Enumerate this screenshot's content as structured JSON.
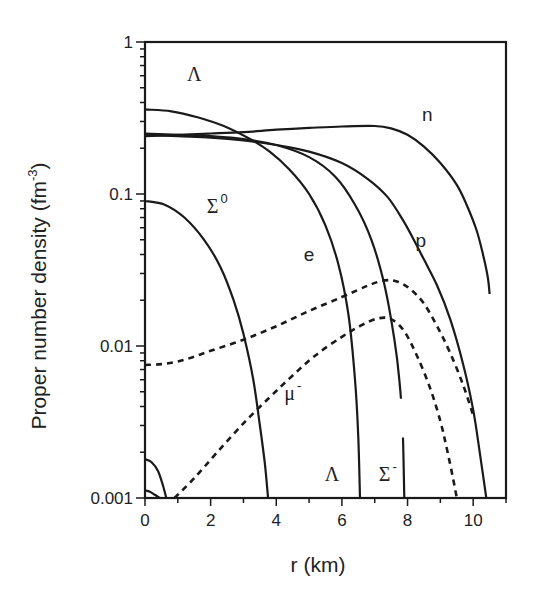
{
  "chart_data": {
    "type": "line",
    "title": "",
    "xlabel": "r (km)",
    "ylabel": "Proper number density (fm^-3)",
    "ylabel_parts": {
      "main": "Proper number density (fm",
      "sup": "-3",
      "close": ")"
    },
    "xlim": [
      0,
      11
    ],
    "ylim": [
      0.001,
      1
    ],
    "yscale": "log",
    "grid": false,
    "x_ticks": [
      0,
      2,
      4,
      6,
      8,
      10
    ],
    "x_tick_labels": [
      "0",
      "2",
      "4",
      "6",
      "8",
      "10"
    ],
    "y_ticks": [
      1,
      0.1,
      0.01,
      0.001
    ],
    "y_tick_labels": [
      "1",
      "0.1",
      "0.01",
      "0.001"
    ],
    "series": [
      {
        "name": "n",
        "style": "solid",
        "x": [
          0,
          1,
          2,
          3,
          4,
          5,
          6,
          7,
          7.5,
          8,
          8.5,
          9,
          9.5,
          9.8,
          10.1,
          10.3,
          10.45,
          10.5
        ],
        "y": [
          0.24,
          0.245,
          0.25,
          0.255,
          0.265,
          0.272,
          0.278,
          0.28,
          0.27,
          0.245,
          0.205,
          0.16,
          0.115,
          0.085,
          0.058,
          0.04,
          0.028,
          0.022
        ]
      },
      {
        "name": "p",
        "style": "solid",
        "x": [
          0,
          1,
          2,
          3,
          4,
          5,
          6,
          6.8,
          7.4,
          7.9,
          8.3,
          8.5,
          8.9,
          9.3,
          9.7,
          10.0,
          10.2,
          10.4
        ],
        "y": [
          0.245,
          0.24,
          0.235,
          0.225,
          0.21,
          0.19,
          0.16,
          0.125,
          0.095,
          0.065,
          0.045,
          0.037,
          0.025,
          0.015,
          0.0075,
          0.0038,
          0.002,
          0.001
        ]
      },
      {
        "name": "Σ-",
        "style": "solid",
        "x": [
          0,
          1,
          2,
          3,
          4,
          5,
          5.8,
          6.4,
          6.9,
          7.3,
          7.6,
          7.75,
          7.85,
          7.9
        ],
        "y": [
          0.25,
          0.245,
          0.24,
          0.23,
          0.21,
          0.175,
          0.13,
          0.085,
          0.05,
          0.025,
          0.011,
          0.006,
          0.003,
          0.001
        ],
        "gap": [
          0.0045,
          0.0025
        ]
      },
      {
        "name": "Λ",
        "style": "solid",
        "x": [
          0,
          0.8,
          1.6,
          2.4,
          3.2,
          3.8,
          4.4,
          5.0,
          5.5,
          5.9,
          6.2,
          6.4,
          6.5,
          6.55
        ],
        "y": [
          0.36,
          0.35,
          0.32,
          0.28,
          0.23,
          0.19,
          0.145,
          0.1,
          0.062,
          0.034,
          0.016,
          0.006,
          0.0025,
          0.001
        ]
      },
      {
        "name": "Σ0",
        "style": "solid",
        "x": [
          0,
          0.6,
          1.2,
          1.8,
          2.3,
          2.7,
          3.0,
          3.3,
          3.5,
          3.65,
          3.75
        ],
        "y": [
          0.09,
          0.085,
          0.07,
          0.05,
          0.033,
          0.02,
          0.012,
          0.006,
          0.003,
          0.0017,
          0.001
        ]
      },
      {
        "name": "e",
        "style": "dashed",
        "x": [
          0,
          0.5,
          1,
          1.5,
          2,
          3,
          4,
          5,
          6,
          6.8,
          7.3,
          7.7,
          8.1,
          8.5,
          8.9,
          9.3,
          9.7,
          10.0
        ],
        "y": [
          0.0075,
          0.0076,
          0.0079,
          0.0085,
          0.0093,
          0.011,
          0.0135,
          0.017,
          0.021,
          0.025,
          0.027,
          0.0265,
          0.0235,
          0.019,
          0.0135,
          0.009,
          0.0055,
          0.0035
        ]
      },
      {
        "name": "μ-",
        "style": "dashed",
        "x": [
          0.9,
          1.5,
          2.2,
          3.0,
          3.8,
          4.5,
          5.2,
          6.0,
          6.6,
          7.1,
          7.5,
          7.9,
          8.3,
          8.7,
          9.0,
          9.2,
          9.4,
          9.5
        ],
        "y": [
          0.001,
          0.00135,
          0.002,
          0.0031,
          0.0046,
          0.0064,
          0.0087,
          0.0115,
          0.0137,
          0.0152,
          0.015,
          0.0125,
          0.0085,
          0.0052,
          0.0032,
          0.0021,
          0.0013,
          0.001
        ]
      },
      {
        "name": "minor-1",
        "style": "solid",
        "x": [
          0,
          0.2,
          0.4,
          0.55,
          0.65
        ],
        "y": [
          0.0018,
          0.00172,
          0.0015,
          0.0012,
          0.001
        ]
      },
      {
        "name": "minor-2",
        "style": "solid",
        "x": [
          0,
          0.15,
          0.3,
          0.45
        ],
        "y": [
          0.00112,
          0.0011,
          0.00105,
          0.001
        ]
      }
    ],
    "annotations": [
      {
        "text": "Λ",
        "x": 1.5,
        "y": 0.55,
        "font": "serif"
      },
      {
        "text": "n",
        "x": 8.6,
        "y": 0.3,
        "font": "sans"
      },
      {
        "text": "Σ",
        "sup": "0",
        "x": 2.2,
        "y": 0.075,
        "font": "serif"
      },
      {
        "text": "p",
        "x": 8.4,
        "y": 0.045,
        "font": "sans"
      },
      {
        "text": "e",
        "x": 5.0,
        "y": 0.036,
        "font": "sans"
      },
      {
        "text": "μ",
        "sup": "-",
        "x": 4.5,
        "y": 0.0044,
        "font": "serif"
      },
      {
        "text": "Λ",
        "x": 5.7,
        "y": 0.0013,
        "font": "serif"
      },
      {
        "text": "Σ",
        "sup": "-",
        "x": 7.4,
        "y": 0.0013,
        "font": "serif"
      }
    ]
  },
  "layout": {
    "plot_left": 145,
    "plot_right": 506,
    "plot_top": 42,
    "plot_bottom": 498,
    "x_min": 0,
    "x_max": 11,
    "ylog_min": -3,
    "ylog_max": 0
  }
}
